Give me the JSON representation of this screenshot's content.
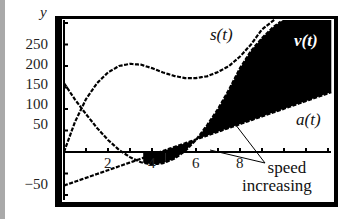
{
  "chart_data": {
    "type": "line",
    "title": "",
    "xlabel": "t",
    "ylabel": "y",
    "xlim": [
      0,
      12.2
    ],
    "ylim": [
      -110,
      305
    ],
    "grid": false,
    "y_ticks": [
      -50,
      50,
      100,
      150,
      200,
      250
    ],
    "y_tick_labels": [
      "−50",
      "50",
      "100",
      "150",
      "200",
      "250"
    ],
    "x_ticks": [
      1,
      2,
      3,
      4,
      5,
      6,
      7,
      8,
      9,
      10,
      11,
      12
    ],
    "x_tick_labels": [
      "2",
      "4",
      "6",
      "8"
    ],
    "x_tick_label_values": [
      2,
      4,
      6,
      8
    ],
    "series": [
      {
        "name": "s(t)",
        "x": [
          0,
          0.5,
          1,
          1.5,
          2,
          2.5,
          3,
          3.5,
          4,
          4.5,
          5,
          5.5,
          6,
          6.5,
          7,
          7.5,
          8,
          8.5,
          9,
          9.5
        ],
        "values": [
          0,
          70,
          123,
          160,
          185,
          200,
          205,
          203,
          195,
          185,
          177,
          172,
          172,
          176,
          186,
          200,
          222,
          250,
          285,
          305
        ]
      },
      {
        "name": "v(t)",
        "x": [
          0,
          0.5,
          1,
          1.5,
          2,
          2.5,
          3,
          3.5,
          4,
          4.5,
          5,
          5.5,
          6,
          6.5,
          7,
          7.5,
          8,
          8.5,
          9,
          9.5,
          9.9
        ],
        "values": [
          160,
          122,
          88,
          56,
          28,
          5,
          -12,
          -24,
          -29,
          -26,
          -16,
          2,
          28,
          62,
          100,
          145,
          195,
          235,
          265,
          290,
          305
        ]
      },
      {
        "name": "a(t)",
        "x": [
          0,
          12.2
        ],
        "values": [
          -78,
          140
        ]
      }
    ],
    "shaded_regions": [
      {
        "description": "area between v(t) and t-axis where speed is increasing",
        "t_range": [
          3.6,
          4.6
        ],
        "sign": "negative"
      },
      {
        "description": "area between v(t) and a(t)/axis where speed is increasing",
        "t_range": [
          4.6,
          12.2
        ],
        "sign": "positive"
      }
    ],
    "legend": [],
    "annotations": [
      {
        "text": "s(t)",
        "position": "near top, t≈6.8"
      },
      {
        "text": "v(t)",
        "position": "top right, white text on black region"
      },
      {
        "text": "a(t)",
        "position": "right, below a(t) line"
      },
      {
        "text": "speed increasing",
        "position": "lower right with two pointer lines"
      }
    ]
  },
  "labels": {
    "y_var": "y",
    "y_ticks": [
      {
        "text": "250",
        "top": 37
      },
      {
        "text": "200",
        "top": 57
      },
      {
        "text": "150",
        "top": 77
      },
      {
        "text": "100",
        "top": 97
      },
      {
        "text": "50",
        "top": 117
      },
      {
        "text": "−50",
        "top": 177
      }
    ],
    "x_ticks": [
      {
        "text": "2",
        "left": 104
      },
      {
        "text": "4",
        "left": 148
      },
      {
        "text": "6",
        "left": 192
      },
      {
        "text": "8",
        "left": 236
      }
    ],
    "s_label": "s(t)",
    "v_label": "v(t)",
    "a_label": "a(t)",
    "annotation_line1": "speed",
    "annotation_line2": "increasing"
  }
}
